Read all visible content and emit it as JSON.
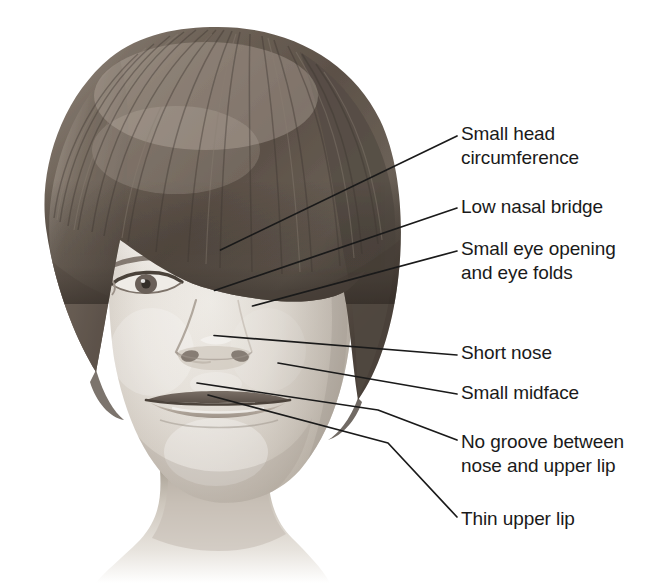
{
  "figure": {
    "width": 666,
    "height": 583,
    "background_color": "#ffffff",
    "line_color": "#1a1a1a",
    "text_color": "#1a1a1a"
  },
  "annotations": [
    {
      "id": "small-head-circumference",
      "label": "Small head\ncircumference",
      "text_x": 461,
      "text_y": 122,
      "leader": "M 220.5,250 L 457,136"
    },
    {
      "id": "low-nasal-bridge",
      "label": "Low nasal bridge",
      "text_x": 461,
      "text_y": 195,
      "leader": "M 214.5,290.5 L 457,208"
    },
    {
      "id": "small-eye-opening-and-eye-folds",
      "label": "Small eye opening\nand eye folds",
      "text_x": 461,
      "text_y": 237,
      "leader": "M 252.5,306 L 457,251"
    },
    {
      "id": "short-nose",
      "label": "Short nose",
      "text_x": 461,
      "text_y": 341,
      "leader": "M 214,335.5 L 457,355"
    },
    {
      "id": "small-midface",
      "label": "Small midface",
      "text_x": 461,
      "text_y": 381,
      "leader": "M 278,363 L 457,394"
    },
    {
      "id": "no-groove-between-nose-and-upper-lip",
      "label": "No groove between\nnose and upper lip",
      "text_x": 461,
      "text_y": 430,
      "leader": "M 197,383 L 378,410 L 457,440"
    },
    {
      "id": "thin-upper-lip",
      "label": "Thin upper lip",
      "text_x": 461,
      "text_y": 507,
      "leader": "M 208,395 L 388,443 L 457,517"
    }
  ]
}
